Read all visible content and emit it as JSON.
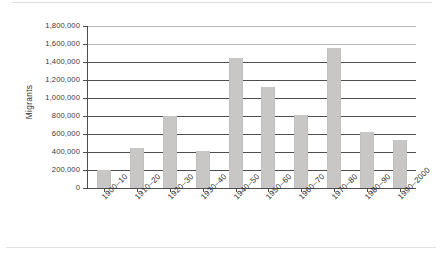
{
  "chart_data": {
    "type": "bar",
    "title": "",
    "xlabel": "",
    "ylabel": "Migrants",
    "ylim": [
      0,
      1800000
    ],
    "ytick_step": 200000,
    "grid": true,
    "legend": false,
    "bar_color": "#c9c7c5",
    "axis_color": "#4d4d4d",
    "categories": [
      "1900–10",
      "1910–20",
      "1920–30",
      "1930–40",
      "1940–50",
      "1950–60",
      "1960–70",
      "1970–80",
      "1980–90",
      "1990–2000"
    ],
    "values": [
      200000,
      440000,
      800000,
      410000,
      1450000,
      1120000,
      810000,
      1560000,
      620000,
      530000
    ],
    "ytick_labels": [
      "0",
      "200,000",
      "400,000",
      "600,000",
      "800,000",
      "1,000,000",
      "1,200,000",
      "1,400,000",
      "1,600,000",
      "1,800,000"
    ],
    "ytick_values": [
      0,
      200000,
      400000,
      600000,
      800000,
      1000000,
      1200000,
      1400000,
      1600000,
      1800000
    ]
  }
}
